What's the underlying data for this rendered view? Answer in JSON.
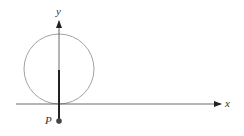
{
  "diagram": {
    "type": "cycloid-setup",
    "labels": {
      "x_axis": "x",
      "y_axis": "y",
      "point": "P"
    },
    "colors": {
      "axis": "#333333",
      "circle": "#888888",
      "radius": "#222222",
      "point": "#444444"
    },
    "geometry": {
      "circle_center": [
        59,
        69
      ],
      "circle_radius": 35,
      "x_axis_y": 104,
      "y_axis_x": 59,
      "point_position": [
        59,
        121
      ]
    }
  }
}
